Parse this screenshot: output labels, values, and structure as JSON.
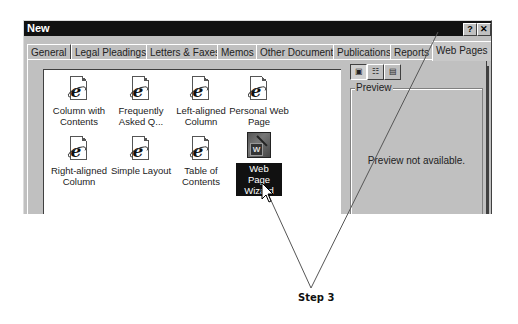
{
  "dialog": {
    "title": "New",
    "help_button": "?",
    "close_button": "✕"
  },
  "tabs": [
    {
      "label": "General",
      "active": false
    },
    {
      "label": "Legal Pleadings",
      "active": false
    },
    {
      "label": "Letters & Faxes",
      "active": false
    },
    {
      "label": "Memos",
      "active": false
    },
    {
      "label": "Other Documents",
      "active": false
    },
    {
      "label": "Publications",
      "active": false
    },
    {
      "label": "Reports",
      "active": false
    },
    {
      "label": "Web Pages",
      "active": true
    }
  ],
  "templates": [
    {
      "label": "Column with Contents",
      "icon": "ie-document-icon",
      "selected": false
    },
    {
      "label": "Frequently Asked Q...",
      "icon": "ie-document-icon",
      "selected": false
    },
    {
      "label": "Left-aligned Column",
      "icon": "ie-document-icon",
      "selected": false
    },
    {
      "label": "Personal Web Page",
      "icon": "ie-document-icon",
      "selected": false
    },
    {
      "label": "Right-aligned Column",
      "icon": "ie-document-icon",
      "selected": false
    },
    {
      "label": "Simple Layout",
      "icon": "ie-document-icon",
      "selected": false
    },
    {
      "label": "Table of Contents",
      "icon": "ie-document-icon",
      "selected": false
    },
    {
      "label": "Web Page Wizard",
      "icon": "wizard-icon",
      "selected": true
    }
  ],
  "view_buttons": [
    {
      "name": "large-icons-view",
      "glyph": "▣",
      "pressed": true
    },
    {
      "name": "list-view",
      "glyph": "☷",
      "pressed": false
    },
    {
      "name": "details-view",
      "glyph": "▤",
      "pressed": false
    }
  ],
  "preview": {
    "legend": "Preview",
    "message": "Preview not available."
  },
  "annotation": {
    "label": "Step 3"
  }
}
